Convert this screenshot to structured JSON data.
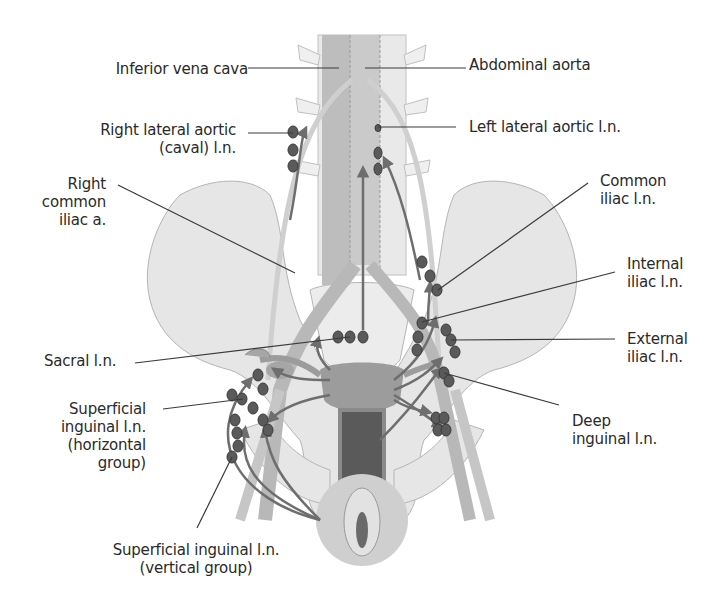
{
  "figure": {
    "colors": {
      "bone": "#e6e6e6",
      "bone_outline": "#b5b5b5",
      "vessel": "#bdbdbd",
      "vessel_dark": "#a8a8a8",
      "organ": "#9c9c9c",
      "organ_dark": "#4a4a4a",
      "node": "#5a5a5a",
      "arrow": "#6e6e6e",
      "leader": "#3a3a3a",
      "text": "#2a2a2a",
      "vulva_disc": "#cfcfcf"
    },
    "labels": {
      "inferior_vena_cava": "Inferior vena cava",
      "abdominal_aorta": "Abdominal aorta",
      "right_lateral_aortic": "Right lateral aortic\n(caval) l.n.",
      "left_lateral_aortic": "Left lateral aortic l.n.",
      "right_common_iliac": "Right\ncommon\niliac a.",
      "common_iliac_ln": "Common\niliac l.n.",
      "internal_iliac_ln": "Internal\niliac l.n.",
      "sacral_ln": "Sacral l.n.",
      "external_iliac_ln": "External\niliac l.n.",
      "superficial_inguinal_horizontal": "Superficial\ninguinal l.n.\n(horizontal\ngroup)",
      "deep_inguinal_ln": "Deep\ninguinal l.n.",
      "superficial_inguinal_vertical": "Superficial inguinal l.n.\n(vertical group)"
    }
  }
}
